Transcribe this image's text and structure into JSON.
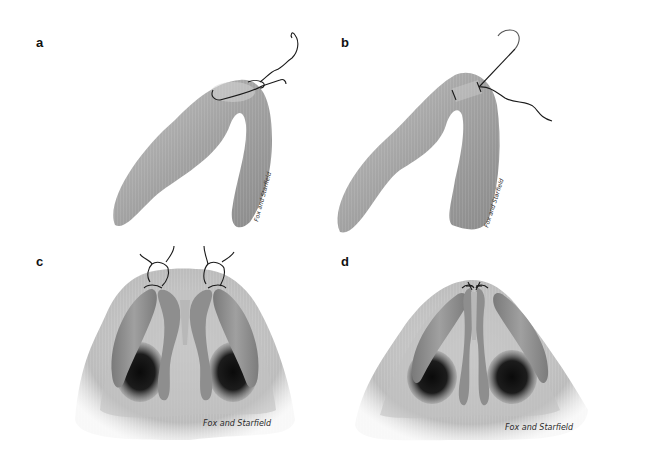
{
  "figure": {
    "panels": [
      {
        "id": "a",
        "label": "a",
        "view": "lateral cartilage, suture passed and tied",
        "signature": "Fox and Starfield"
      },
      {
        "id": "b",
        "label": "b",
        "view": "lateral cartilage, needle passing through dome",
        "signature": "Fox and Starfield"
      },
      {
        "id": "c",
        "label": "c",
        "view": "basal nasal view, sutures being tied at both domes",
        "signature": "Fox and Starfield"
      },
      {
        "id": "d",
        "label": "d",
        "view": "basal nasal view, domes after sutures tightened",
        "signature": "Fox and Starfield"
      }
    ],
    "colors": {
      "background": "#ffffff",
      "cartilage_light": "#c8c8c8",
      "cartilage_mid": "#9a9a9a",
      "cartilage_dark": "#6e6e6e",
      "nostril": "#141414",
      "suture": "#1a1a1a",
      "label": "#111111"
    }
  }
}
